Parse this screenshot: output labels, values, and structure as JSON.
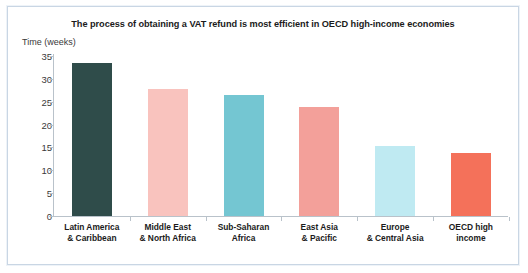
{
  "figure": {
    "title": "The process of obtaining a VAT refund is most efficient in OECD high-income economies",
    "y_axis_label": "Time (weeks)",
    "border_color": "#c9d6e4",
    "background": "#ffffff",
    "axis_color": "#b9c2ca"
  },
  "chart_data": {
    "type": "bar",
    "title": "The process of obtaining a VAT refund is most efficient in OECD high-income economies",
    "xlabel": "",
    "ylabel": "Time (weeks)",
    "ylim": [
      0,
      35
    ],
    "yticks": [
      0,
      5,
      10,
      15,
      20,
      25,
      30,
      35
    ],
    "ytick_labels": [
      "0",
      "5",
      "10",
      "15",
      "20",
      "25",
      "30",
      "35"
    ],
    "grid": false,
    "legend": "none",
    "categories": [
      "Latin America & Caribbean",
      "Middle East & North Africa",
      "Sub-Saharan Africa",
      "East Asia & Pacific",
      "Europe & Central Asia",
      "OECD high income"
    ],
    "category_lines": [
      {
        "line1": "Latin America",
        "line2": "& Caribbean"
      },
      {
        "line1": "Middle East",
        "line2": "& North Africa"
      },
      {
        "line1": "Sub-Saharan",
        "line2": "Africa"
      },
      {
        "line1": "East Asia",
        "line2": "& Pacific"
      },
      {
        "line1": "Europe",
        "line2": "& Central Asia"
      },
      {
        "line1": "OECD high",
        "line2": "income"
      }
    ],
    "values": [
      33.5,
      27.8,
      26.5,
      23.8,
      15.3,
      13.7
    ],
    "colors": [
      "#2f4c4a",
      "#f9c3be",
      "#74c6d2",
      "#f3a09a",
      "#bfeaf2",
      "#f4715a"
    ]
  }
}
